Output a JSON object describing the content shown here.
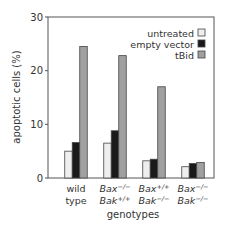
{
  "chart_data": {
    "type": "bar",
    "title": "",
    "xlabel": "genotypes",
    "ylabel": "apoptotic cells (%)",
    "ylim": [
      0,
      30
    ],
    "yticks": [
      0,
      10,
      20,
      30
    ],
    "grid": false,
    "legend_position": "top-right",
    "categories": [
      {
        "line1": "wild",
        "line2": "type",
        "italic": false
      },
      {
        "line1": "Bax",
        "sup1": "−/−",
        "line2": "Bak",
        "sup2": "+/+",
        "italic": true
      },
      {
        "line1": "Bax",
        "sup1": "+/+",
        "line2": "Bak",
        "sup2": "−/−",
        "italic": true
      },
      {
        "line1": "Bax",
        "sup1": "−/−",
        "line2": "Bak",
        "sup2": "−/−",
        "italic": true
      }
    ],
    "series": [
      {
        "name": "untreated",
        "color": "#eeeeee",
        "values": [
          5.0,
          6.5,
          3.2,
          2.1
        ]
      },
      {
        "name": "empty vector",
        "color": "#1a1a1a",
        "values": [
          6.6,
          8.8,
          3.5,
          2.7
        ]
      },
      {
        "name": "tBid",
        "color": "#a0a0a0",
        "values": [
          24.5,
          22.8,
          17.0,
          2.9
        ]
      }
    ]
  }
}
